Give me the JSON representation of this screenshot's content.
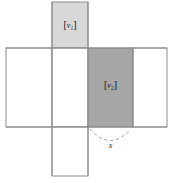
{
  "diagram": {
    "type": "cube-net",
    "background_color": "#ffffff",
    "stroke_color": "#8c8c8c",
    "stroke_width": 1,
    "faces": [
      {
        "id": "top-face",
        "name": "top-shaded-face",
        "x": 52,
        "y": 2,
        "width": 36,
        "height": 46,
        "fill": "#d8d8d8",
        "label_bracket_open": "[",
        "label_symbol": "v",
        "label_subscript": "1",
        "label_bracket_close": "]"
      },
      {
        "id": "left-face",
        "name": "left-blank-face",
        "x": 6,
        "y": 48,
        "width": 46,
        "height": 79,
        "fill": "#ffffff",
        "label_bracket_open": "",
        "label_symbol": "",
        "label_subscript": "",
        "label_bracket_close": ""
      },
      {
        "id": "middle-face",
        "name": "middle-blank-face",
        "x": 52,
        "y": 48,
        "width": 36,
        "height": 79,
        "fill": "#ffffff",
        "label_bracket_open": "",
        "label_symbol": "",
        "label_subscript": "",
        "label_bracket_close": ""
      },
      {
        "id": "center-face",
        "name": "center-shaded-face",
        "x": 88,
        "y": 48,
        "width": 45,
        "height": 79,
        "fill": "#a6a6a6",
        "label_bracket_open": "[",
        "label_symbol": "v",
        "label_subscript": "2",
        "label_bracket_close": "]"
      },
      {
        "id": "right-face",
        "name": "right-blank-face",
        "x": 133,
        "y": 48,
        "width": 34,
        "height": 79,
        "fill": "#ffffff",
        "label_bracket_open": "",
        "label_symbol": "",
        "label_subscript": "",
        "label_bracket_close": ""
      },
      {
        "id": "bottom-face",
        "name": "bottom-blank-face",
        "x": 52,
        "y": 127,
        "width": 36,
        "height": 49,
        "fill": "#ffffff",
        "label_bracket_open": "",
        "label_symbol": "",
        "label_subscript": "",
        "label_bracket_close": ""
      }
    ],
    "arc": {
      "name": "dimension-arc",
      "style": "dashed",
      "color": "#9a9a9a",
      "dash_pattern": "3 3",
      "start_x": 90,
      "start_y": 128,
      "end_x": 131,
      "end_y": 128,
      "sag_y": 146
    },
    "dimension_label": {
      "name": "x-dimension-label",
      "text": "x"
    }
  }
}
